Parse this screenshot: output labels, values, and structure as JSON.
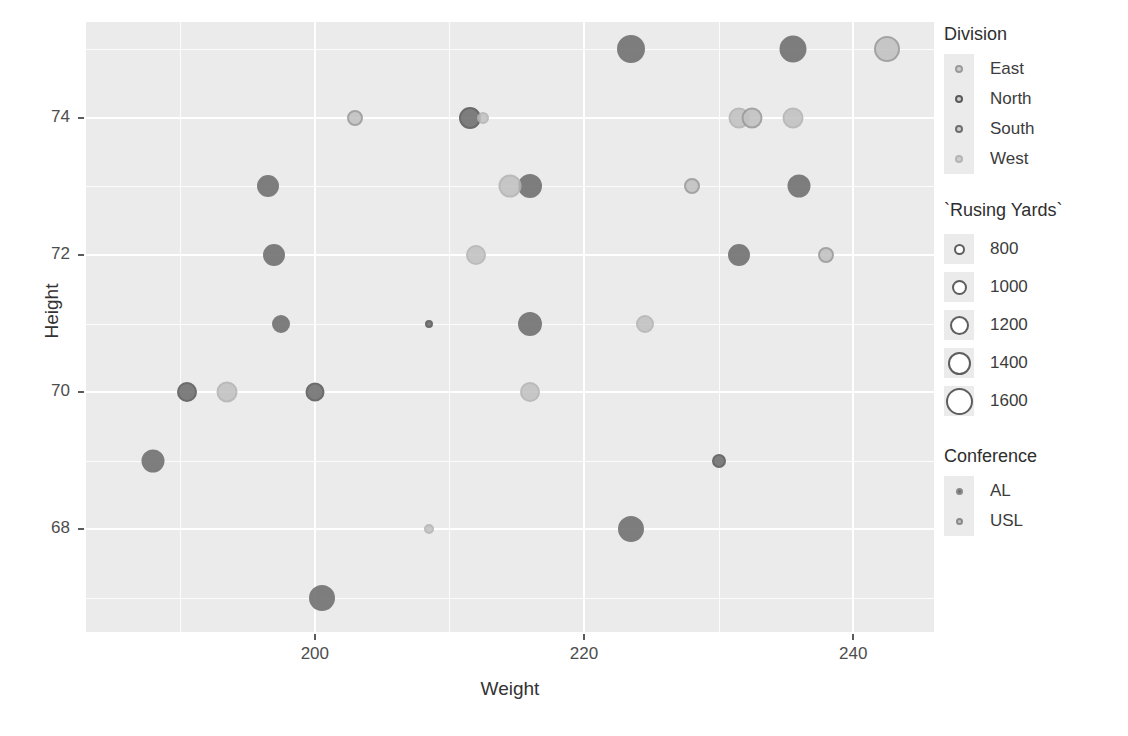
{
  "chart_data": {
    "type": "scatter",
    "title": "",
    "xlabel": "Weight",
    "ylabel": "Height",
    "xlim": [
      183,
      246
    ],
    "ylim": [
      66.5,
      75.4
    ],
    "xticks": [
      200,
      220,
      240
    ],
    "yticks": [
      68,
      70,
      72,
      74
    ],
    "grid": true,
    "legend_position": "right",
    "encodings": {
      "x": "Weight",
      "y": "Height",
      "size": "`Rusing Yards`",
      "color": "Division",
      "shape_or_fill": "Conference"
    },
    "points": [
      {
        "x": 188,
        "y": 69,
        "size": 1250,
        "division": "South",
        "conference": "AL"
      },
      {
        "x": 190.5,
        "y": 70,
        "size": 1100,
        "division": "North",
        "conference": "AL"
      },
      {
        "x": 193.5,
        "y": 70,
        "size": 1150,
        "division": "West",
        "conference": "USL"
      },
      {
        "x": 196.5,
        "y": 73,
        "size": 1200,
        "division": "South",
        "conference": "AL"
      },
      {
        "x": 197,
        "y": 72,
        "size": 1200,
        "division": "South",
        "conference": "AL"
      },
      {
        "x": 197.5,
        "y": 71,
        "size": 1000,
        "division": "South",
        "conference": "AL"
      },
      {
        "x": 200,
        "y": 70,
        "size": 1050,
        "division": "North",
        "conference": "AL"
      },
      {
        "x": 200.5,
        "y": 67,
        "size": 1400,
        "division": "South",
        "conference": "AL"
      },
      {
        "x": 203,
        "y": 74,
        "size": 900,
        "division": "East",
        "conference": "USL"
      },
      {
        "x": 208.5,
        "y": 71,
        "size": 500,
        "division": "North",
        "conference": "AL"
      },
      {
        "x": 208.5,
        "y": 68,
        "size": 600,
        "division": "West",
        "conference": "USL"
      },
      {
        "x": 211.5,
        "y": 74,
        "size": 1200,
        "division": "North",
        "conference": "AL"
      },
      {
        "x": 212.5,
        "y": 74,
        "size": 700,
        "division": "West",
        "conference": "USL"
      },
      {
        "x": 212,
        "y": 72,
        "size": 1100,
        "division": "West",
        "conference": "USL"
      },
      {
        "x": 214.5,
        "y": 73,
        "size": 1250,
        "division": "West",
        "conference": "USL"
      },
      {
        "x": 216,
        "y": 73,
        "size": 1300,
        "division": "South",
        "conference": "AL"
      },
      {
        "x": 216,
        "y": 71,
        "size": 1300,
        "division": "South",
        "conference": "AL"
      },
      {
        "x": 216,
        "y": 70,
        "size": 1100,
        "division": "West",
        "conference": "USL"
      },
      {
        "x": 223.5,
        "y": 75,
        "size": 1500,
        "division": "South",
        "conference": "AL"
      },
      {
        "x": 223.5,
        "y": 68,
        "size": 1400,
        "division": "South",
        "conference": "AL"
      },
      {
        "x": 224.5,
        "y": 71,
        "size": 1000,
        "division": "West",
        "conference": "USL"
      },
      {
        "x": 228,
        "y": 73,
        "size": 900,
        "division": "East",
        "conference": "USL"
      },
      {
        "x": 230,
        "y": 69,
        "size": 800,
        "division": "North",
        "conference": "AL"
      },
      {
        "x": 231.5,
        "y": 74,
        "size": 1150,
        "division": "West",
        "conference": "USL"
      },
      {
        "x": 232.5,
        "y": 74,
        "size": 1150,
        "division": "East",
        "conference": "USL"
      },
      {
        "x": 231.5,
        "y": 72,
        "size": 1200,
        "division": "South",
        "conference": "AL"
      },
      {
        "x": 235.5,
        "y": 75,
        "size": 1450,
        "division": "South",
        "conference": "AL"
      },
      {
        "x": 235.5,
        "y": 74,
        "size": 1150,
        "division": "West",
        "conference": "USL"
      },
      {
        "x": 236,
        "y": 73,
        "size": 1250,
        "division": "South",
        "conference": "AL"
      },
      {
        "x": 238,
        "y": 72,
        "size": 900,
        "division": "East",
        "conference": "USL"
      },
      {
        "x": 242.5,
        "y": 75,
        "size": 1400,
        "division": "East",
        "conference": "USL"
      }
    ]
  },
  "axes": {
    "x": {
      "label": "Weight",
      "ticks": [
        "200",
        "220",
        "240"
      ]
    },
    "y": {
      "label": "Height",
      "ticks": [
        "74",
        "72",
        "70",
        "68"
      ]
    }
  },
  "legends": {
    "division": {
      "title": "Division",
      "items": [
        {
          "label": "East",
          "color": "#9a9a9a"
        },
        {
          "label": "North",
          "color": "#5a5a5a"
        },
        {
          "label": "South",
          "color": "#6e6e6e"
        },
        {
          "label": "West",
          "color": "#b4b4b4"
        }
      ]
    },
    "size": {
      "title": "`Rusing Yards`",
      "items": [
        {
          "label": "800",
          "diameter": 11
        },
        {
          "label": "1000",
          "diameter": 15
        },
        {
          "label": "1200",
          "diameter": 19
        },
        {
          "label": "1400",
          "diameter": 23
        },
        {
          "label": "1600",
          "diameter": 27
        }
      ]
    },
    "conference": {
      "title": "Conference",
      "items": [
        {
          "label": "AL",
          "fill": "#6e6e6e"
        },
        {
          "label": "USL",
          "fill": "#c2c2c2"
        }
      ]
    }
  },
  "colors": {
    "panel_background": "#ebebeb",
    "grid_line": "#ffffff",
    "page_background": "#ffffff",
    "text": "#3a3a3a"
  }
}
